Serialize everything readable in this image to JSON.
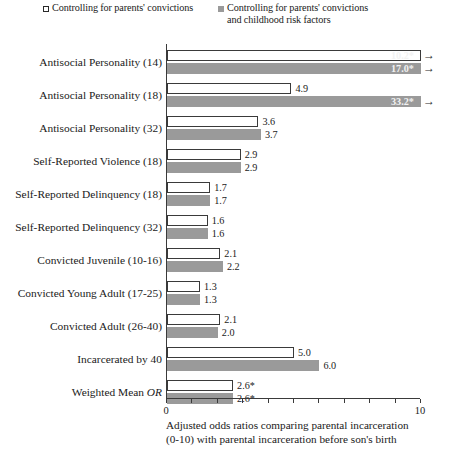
{
  "legend": {
    "entries": [
      {
        "marker": "open-square-icon",
        "label": "Controlling for parents' convictions"
      },
      {
        "marker": "filled-square-icon",
        "label": "Controlling for parents' convictions\nand childhood risk factors"
      }
    ]
  },
  "axis": {
    "x_tick_labels": [
      "0",
      "10"
    ],
    "x_min": 0,
    "x_max": 10
  },
  "caption": {
    "text": "Adjusted odds ratios comparing parental incarceration\n(0-10) with parental incarceration before son's birth"
  },
  "chart_data": {
    "type": "bar",
    "orientation": "horizontal",
    "title": "",
    "xlabel": "Adjusted odds ratios comparing parental incarceration (0-10) with parental incarceration before son's birth",
    "ylabel": "",
    "xlim": [
      0,
      10
    ],
    "grid": false,
    "legend_position": "top",
    "categories": [
      "Antisocial Personality (14)",
      "Antisocial Personality (18)",
      "Antisocial Personality (32)",
      "Self-Reported Violence (18)",
      "Self-Reported Delinquency (18)",
      "Self-Reported Delinquency (32)",
      "Convicted Juvenile (10-16)",
      "Convicted Young Adult (17-25)",
      "Convicted Adult (26-40)",
      "Incarcerated by 40",
      "Weighted Mean OR"
    ],
    "series": [
      {
        "name": "Controlling for parents' convictions",
        "style": "open",
        "values": [
          10.2,
          4.9,
          3.6,
          2.9,
          1.7,
          1.6,
          2.1,
          1.3,
          2.1,
          5.0,
          2.6
        ],
        "labels": [
          "10.2*",
          "4.9",
          "3.6",
          "2.9",
          "1.7",
          "1.6",
          "2.1",
          "1.3",
          "2.1",
          "5.0",
          "2.6*"
        ],
        "off_scale": [
          true,
          false,
          false,
          false,
          false,
          false,
          false,
          false,
          false,
          false,
          false
        ]
      },
      {
        "name": "Controlling for parents' convictions and childhood risk factors",
        "style": "filled",
        "values": [
          17.0,
          33.2,
          3.7,
          2.9,
          1.7,
          1.6,
          2.2,
          1.3,
          2.0,
          6.0,
          2.6
        ],
        "labels": [
          "17.0*",
          "33.2*",
          "3.7",
          "2.9",
          "1.7",
          "1.6",
          "2.2",
          "1.3",
          "2.0",
          "6.0",
          "2.6*"
        ],
        "off_scale": [
          true,
          true,
          false,
          false,
          false,
          false,
          false,
          false,
          false,
          false,
          false
        ]
      }
    ]
  }
}
